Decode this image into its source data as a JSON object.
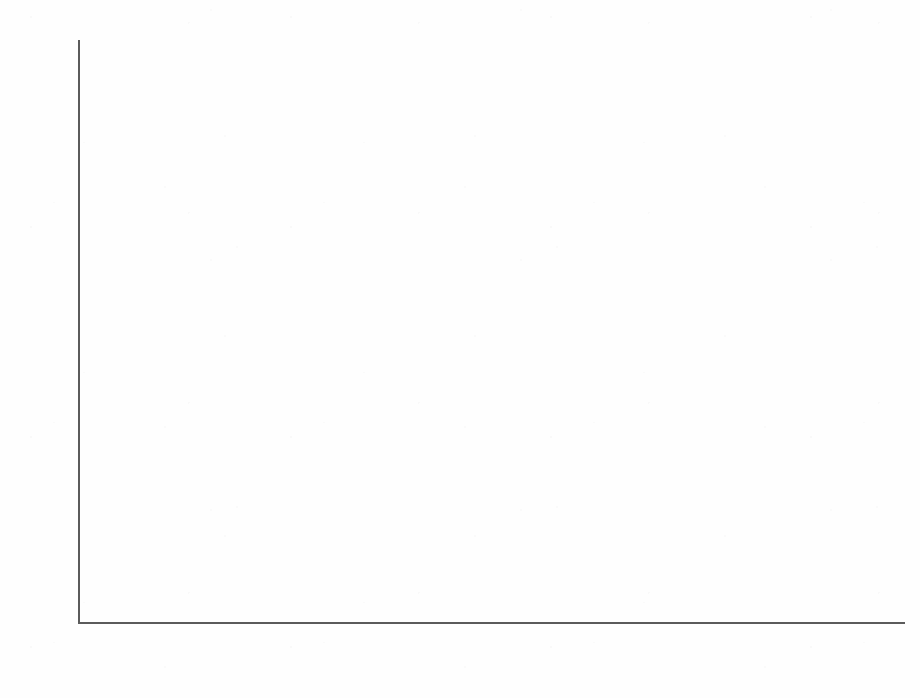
{
  "chart_data": {
    "type": "bar",
    "title": "",
    "subtitle": "",
    "xlabel": "",
    "ylabel": "",
    "ylim": [
      0,
      30
    ],
    "ytick_labels": [
      "30%",
      "25%",
      "20%",
      "15%",
      "10%",
      "5%",
      "0%"
    ],
    "ytick_values": [
      30,
      25,
      20,
      15,
      10,
      5,
      0
    ],
    "grid": false,
    "legend": "none",
    "categories": [
      "U.S.",
      "Border States",
      "Border\nCounties",
      "Border Counties\nw/out San Diego"
    ],
    "category_labels_flat": [
      "U.S.",
      "Border States",
      "Border Counties",
      "Border Counties w/out San Diego"
    ],
    "values": [
      13,
      15.2,
      24.6,
      25.2
    ],
    "data_labels": [
      "13%",
      "15.2%",
      "24.6%",
      "25.2%"
    ],
    "bar_drawn_heights_percent": [
      12.4,
      14.3,
      22.7,
      25.4
    ],
    "annotations": [
      {
        "name": "trend-line",
        "type": "line",
        "description": "upward sloping trend line drawn across the bars",
        "x_start_px": 172,
        "y_start_px": 402,
        "x_end_px": 785,
        "y_end_px": 163,
        "color": "#4a4a4a"
      }
    ],
    "colors": {
      "bar_top": "#e3e3e3",
      "bar_bottom": "#171717",
      "axis": "#5b5b5b",
      "text": "#161616",
      "background": "#ffffff"
    }
  },
  "layout": {
    "plot_left_px": 78,
    "plot_right_px": 905,
    "baseline_y_px": 622,
    "top_y_px": 42,
    "bars": [
      {
        "left_px": 118,
        "width_px": 117,
        "center_px": 176,
        "top_px": 382,
        "label_y_px": 346
      },
      {
        "left_px": 335,
        "width_px": 117,
        "center_px": 393,
        "top_px": 345,
        "label_y_px": 289
      },
      {
        "left_px": 527,
        "width_px": 116,
        "center_px": 585,
        "top_px": 183,
        "label_y_px": 147
      },
      {
        "left_px": 735,
        "width_px": 115,
        "center_px": 792,
        "top_px": 130,
        "label_y_px": 94
      }
    ]
  }
}
